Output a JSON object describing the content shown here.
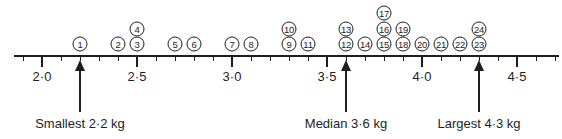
{
  "chart_data": {
    "type": "dot-plot",
    "title": "",
    "xlabel": "Weight (kg)",
    "ylabel": "",
    "xlim": [
      1.85,
      4.75
    ],
    "grid": false,
    "major_ticks": [
      "2·0",
      "2·5",
      "3·0",
      "3·5",
      "4·0",
      "4·5"
    ],
    "major_tick_values": [
      2.0,
      2.5,
      3.0,
      3.5,
      4.0,
      4.5
    ],
    "minor_tick_step": 0.1,
    "points": [
      {
        "label": "1",
        "value": 2.2,
        "stack": 0
      },
      {
        "label": "2",
        "value": 2.4,
        "stack": 0
      },
      {
        "label": "3",
        "value": 2.5,
        "stack": 0
      },
      {
        "label": "4",
        "value": 2.5,
        "stack": 1
      },
      {
        "label": "5",
        "value": 2.7,
        "stack": 0
      },
      {
        "label": "6",
        "value": 2.8,
        "stack": 0
      },
      {
        "label": "7",
        "value": 3.0,
        "stack": 0
      },
      {
        "label": "8",
        "value": 3.1,
        "stack": 0
      },
      {
        "label": "9",
        "value": 3.3,
        "stack": 0
      },
      {
        "label": "10",
        "value": 3.3,
        "stack": 1
      },
      {
        "label": "11",
        "value": 3.4,
        "stack": 0
      },
      {
        "label": "12",
        "value": 3.6,
        "stack": 0
      },
      {
        "label": "13",
        "value": 3.6,
        "stack": 1
      },
      {
        "label": "14",
        "value": 3.7,
        "stack": 0
      },
      {
        "label": "15",
        "value": 3.8,
        "stack": 0
      },
      {
        "label": "16",
        "value": 3.8,
        "stack": 1
      },
      {
        "label": "17",
        "value": 3.8,
        "stack": 2
      },
      {
        "label": "18",
        "value": 3.9,
        "stack": 0
      },
      {
        "label": "19",
        "value": 3.9,
        "stack": 1
      },
      {
        "label": "20",
        "value": 4.0,
        "stack": 0
      },
      {
        "label": "21",
        "value": 4.1,
        "stack": 0
      },
      {
        "label": "22",
        "value": 4.2,
        "stack": 0
      },
      {
        "label": "23",
        "value": 4.3,
        "stack": 0
      },
      {
        "label": "24",
        "value": 4.3,
        "stack": 1
      }
    ],
    "annotations": [
      {
        "text": "Smallest 2·2 kg",
        "value": 2.2
      },
      {
        "text": "Median 3·6 kg",
        "value": 3.6
      },
      {
        "text": "Largest 4·3 kg",
        "value": 4.3
      }
    ],
    "count": 24
  },
  "colors": {
    "ink": "#1e1e1e",
    "background": "#ffffff"
  }
}
